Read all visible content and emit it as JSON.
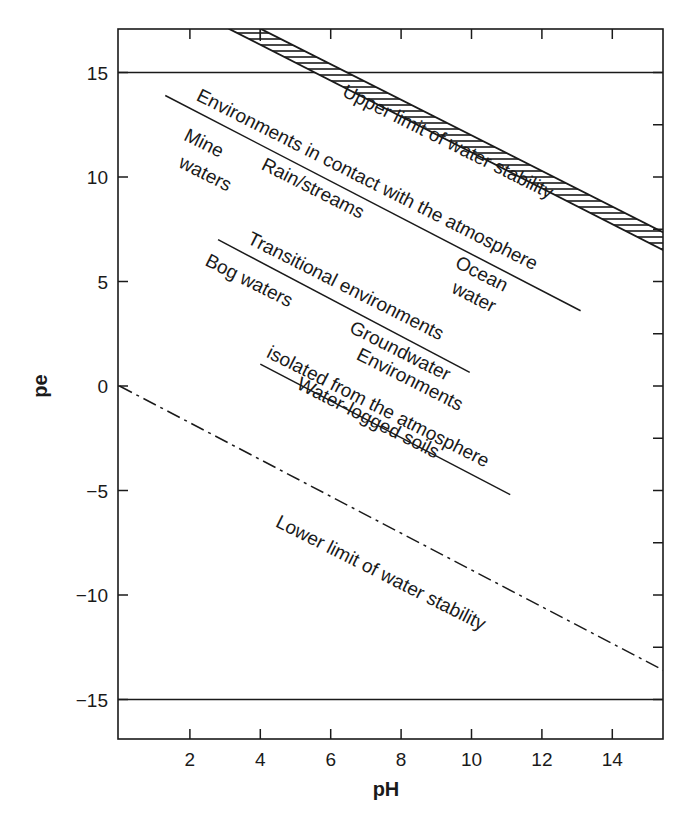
{
  "chart_data": {
    "type": "line",
    "title": "",
    "xlabel": "pH",
    "ylabel": "pe",
    "xlim": [
      0,
      15.45
    ],
    "ylim": [
      -16.9,
      17.1
    ],
    "grid": false,
    "legend": null,
    "x_ticks": [
      2,
      4,
      6,
      8,
      10,
      12,
      14
    ],
    "x_tick_labels": [
      "2",
      "4",
      "6",
      "8",
      "10",
      "12",
      "14"
    ],
    "y_ticks": [
      15,
      10,
      5,
      0,
      -5,
      -10,
      -15
    ],
    "y_tick_labels": [
      "15",
      "10",
      "5",
      "0",
      "−5",
      "−10",
      "−15"
    ],
    "minor_y_ticks": [
      15,
      12.5,
      10,
      7.5,
      5,
      2.5,
      0,
      -2.5,
      -5,
      -7.5,
      -10,
      -12.5,
      -15
    ],
    "horizontal_reference_lines": [
      {
        "name": "pe_upper_bound",
        "y": 15
      },
      {
        "name": "pe_lower_bound",
        "y": -15
      }
    ],
    "series": [
      {
        "name": "Upper limit of water stability (hatched band)",
        "style": "hatched-band",
        "lower_edge": {
          "x": [
            3.1,
            15.45
          ],
          "y": [
            17.1,
            6.5
          ]
        },
        "upper_edge": {
          "x": [
            4.0,
            15.45
          ],
          "y": [
            17.1,
            7.35
          ]
        }
      },
      {
        "name": "Environments in contact with the atmosphere",
        "style": "solid",
        "x": [
          1.3,
          13.1
        ],
        "y": [
          13.9,
          3.6
        ]
      },
      {
        "name": "Transitional environments",
        "style": "solid",
        "x": [
          2.8,
          9.95
        ],
        "y": [
          7.0,
          0.65
        ]
      },
      {
        "name": "Environments isolated from the atmosphere",
        "style": "solid",
        "x": [
          4.0,
          11.1
        ],
        "y": [
          1.05,
          -5.2
        ]
      },
      {
        "name": "Lower limit of water stability",
        "style": "dash-dot",
        "x": [
          0,
          15.45
        ],
        "y": [
          0,
          -13.6
        ]
      }
    ],
    "annotations": [
      {
        "text": "Upper limit of water stability",
        "x": 6.3,
        "y": 13.9,
        "angle": 26.5
      },
      {
        "text": "Environments in contact with the atmosphere",
        "x": 2.15,
        "y": 13.7,
        "angle": 26.8
      },
      {
        "text": "Mine",
        "x": 1.8,
        "y": 11.8,
        "angle": 26.8
      },
      {
        "text": "waters",
        "x": 1.65,
        "y": 10.5,
        "angle": 26.8
      },
      {
        "text": "Rain/streams",
        "x": 4.0,
        "y": 10.4,
        "angle": 26.8
      },
      {
        "text": "Ocean",
        "x": 9.5,
        "y": 5.7,
        "angle": 26.8
      },
      {
        "text": "water",
        "x": 9.4,
        "y": 4.5,
        "angle": 26.8
      },
      {
        "text": "Transitional environments",
        "x": 3.6,
        "y": 6.85,
        "angle": 26.8
      },
      {
        "text": "Bog waters",
        "x": 2.4,
        "y": 5.8,
        "angle": 26.8
      },
      {
        "text": "Groundwater",
        "x": 6.5,
        "y": 2.6,
        "angle": 26.8
      },
      {
        "text": "Environments",
        "x": 6.7,
        "y": 1.3,
        "angle": 26.8
      },
      {
        "text": "isolated from the atmosphere",
        "x": 4.15,
        "y": 1.4,
        "angle": 26.8
      },
      {
        "text": "Water-logged soils",
        "x": 5.0,
        "y": -0.1,
        "angle": 26.8
      },
      {
        "text": "Lower limit of water stability",
        "x": 4.4,
        "y": -6.7,
        "angle": 26.8
      }
    ]
  },
  "axes": {
    "x_title": "pH",
    "y_title": "pe"
  }
}
